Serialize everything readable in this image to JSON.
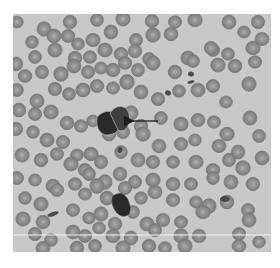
{
  "image": {
    "kind": "blood-smear-micrograph",
    "grayscale": true,
    "frame": {
      "x": 13,
      "y": 14,
      "width": 258,
      "height": 238
    },
    "colors": {
      "page_bg": "#ffffff",
      "smear_bg": "#c8c8c8",
      "rbc_rim": "#7c7c7c",
      "rbc_fill": "#8e8e8e",
      "rbc_center": "#a8a8a8",
      "dark_cell": "#2a2a2a",
      "dark_cell_light": "#3e3e3e",
      "arrow": "#1a1a1a",
      "scan_line": "#f2f2f2"
    },
    "scan_line": {
      "y": 221
    },
    "arrow": {
      "x1": 145,
      "y1": 107,
      "x2": 114,
      "y2": 107
    },
    "dark_cells": [
      {
        "name": "target-cell-left-lobe",
        "path": "M84 103 Q92 94 103 99 L108 112 Q103 122 92 121 Q82 117 84 103 Z"
      },
      {
        "name": "target-cell-right-lobe",
        "path": "M97 99 Q104 89 113 94 Q119 101 115 112 Q111 119 105 116 Z"
      },
      {
        "name": "second-dark-cell",
        "path": "M100 182 Q108 176 114 184 Q119 193 116 200 Q110 205 104 199 Q97 191 100 182 Z"
      }
    ],
    "rbc": [
      [
        4,
        8
      ],
      [
        31,
        15
      ],
      [
        57,
        8
      ],
      [
        84,
        6
      ],
      [
        110,
        5
      ],
      [
        139,
        7
      ],
      [
        162,
        8
      ],
      [
        182,
        6
      ],
      [
        216,
        8
      ],
      [
        245,
        8
      ],
      [
        19,
        28
      ],
      [
        41,
        22
      ],
      [
        55,
        22
      ],
      [
        65,
        30
      ],
      [
        80,
        26
      ],
      [
        98,
        18
      ],
      [
        123,
        26
      ],
      [
        140,
        21
      ],
      [
        158,
        20
      ],
      [
        200,
        36
      ],
      [
        231,
        18
      ],
      [
        249,
        25
      ],
      [
        3,
        50
      ],
      [
        22,
        43
      ],
      [
        42,
        36
      ],
      [
        62,
        44
      ],
      [
        77,
        43
      ],
      [
        92,
        36
      ],
      [
        108,
        40
      ],
      [
        122,
        37
      ],
      [
        136,
        45
      ],
      [
        175,
        44
      ],
      [
        198,
        34
      ],
      [
        215,
        40
      ],
      [
        240,
        34
      ],
      [
        12,
        62
      ],
      [
        29,
        58
      ],
      [
        48,
        60
      ],
      [
        61,
        52
      ],
      [
        75,
        58
      ],
      [
        88,
        54
      ],
      [
        100,
        56
      ],
      [
        112,
        49
      ],
      [
        125,
        56
      ],
      [
        140,
        49
      ],
      [
        162,
        58
      ],
      [
        180,
        47
      ],
      [
        205,
        51
      ],
      [
        222,
        52
      ],
      [
        242,
        48
      ],
      [
        4,
        76
      ],
      [
        24,
        87
      ],
      [
        42,
        75
      ],
      [
        56,
        80
      ],
      [
        70,
        76
      ],
      [
        84,
        72
      ],
      [
        100,
        74
      ],
      [
        114,
        68
      ],
      [
        128,
        78
      ],
      [
        145,
        85
      ],
      [
        166,
        77
      ],
      [
        185,
        76
      ],
      [
        200,
        72
      ],
      [
        213,
        88
      ],
      [
        236,
        70
      ],
      [
        6,
        96
      ],
      [
        22,
        100
      ],
      [
        38,
        98
      ],
      [
        54,
        109
      ],
      [
        68,
        112
      ],
      [
        80,
        107
      ],
      [
        118,
        99
      ],
      [
        128,
        112
      ],
      [
        148,
        104
      ],
      [
        168,
        110
      ],
      [
        185,
        106
      ],
      [
        201,
        108
      ],
      [
        214,
        120
      ],
      [
        237,
        104
      ],
      [
        3,
        115
      ],
      [
        20,
        118
      ],
      [
        34,
        126
      ],
      [
        50,
        128
      ],
      [
        64,
        141
      ],
      [
        78,
        140
      ],
      [
        96,
        120
      ],
      [
        110,
        118
      ],
      [
        130,
        120
      ],
      [
        146,
        132
      ],
      [
        168,
        130
      ],
      [
        182,
        126
      ],
      [
        206,
        132
      ],
      [
        225,
        138
      ],
      [
        246,
        122
      ],
      [
        9,
        141
      ],
      [
        28,
        146
      ],
      [
        44,
        140
      ],
      [
        58,
        150
      ],
      [
        72,
        156
      ],
      [
        88,
        148
      ],
      [
        108,
        138
      ],
      [
        125,
        146
      ],
      [
        140,
        148
      ],
      [
        160,
        148
      ],
      [
        183,
        148
      ],
      [
        200,
        156
      ],
      [
        216,
        146
      ],
      [
        230,
        154
      ],
      [
        249,
        144
      ],
      [
        4,
        164
      ],
      [
        22,
        166
      ],
      [
        40,
        172
      ],
      [
        62,
        170
      ],
      [
        76,
        160
      ],
      [
        92,
        168
      ],
      [
        107,
        160
      ],
      [
        122,
        168
      ],
      [
        140,
        166
      ],
      [
        160,
        170
      ],
      [
        178,
        170
      ],
      [
        200,
        164
      ],
      [
        218,
        168
      ],
      [
        240,
        170
      ],
      [
        12,
        184
      ],
      [
        28,
        190
      ],
      [
        44,
        176
      ],
      [
        72,
        180
      ],
      [
        84,
        172
      ],
      [
        94,
        184
      ],
      [
        112,
        174
      ],
      [
        128,
        184
      ],
      [
        142,
        178
      ],
      [
        160,
        186
      ],
      [
        183,
        188
      ],
      [
        196,
        192
      ],
      [
        214,
        188
      ],
      [
        235,
        196
      ],
      [
        10,
        205
      ],
      [
        30,
        208
      ],
      [
        60,
        196
      ],
      [
        76,
        204
      ],
      [
        88,
        200
      ],
      [
        102,
        210
      ],
      [
        120,
        198
      ],
      [
        134,
        210
      ],
      [
        150,
        206
      ],
      [
        168,
        208
      ],
      [
        190,
        198
      ],
      [
        236,
        206
      ],
      [
        22,
        220
      ],
      [
        38,
        226
      ],
      [
        60,
        218
      ],
      [
        72,
        222
      ],
      [
        86,
        214
      ],
      [
        100,
        222
      ],
      [
        118,
        224
      ],
      [
        142,
        216
      ],
      [
        168,
        222
      ],
      [
        186,
        222
      ],
      [
        226,
        220
      ],
      [
        246,
        228
      ],
      [
        30,
        234
      ],
      [
        64,
        234
      ],
      [
        82,
        232
      ],
      [
        110,
        234
      ],
      [
        136,
        232
      ],
      [
        152,
        234
      ],
      [
        172,
        232
      ],
      [
        226,
        232
      ]
    ],
    "debris": [
      {
        "x": 40,
        "y": 200,
        "w": 12,
        "h": 4,
        "r": -20
      },
      {
        "x": 178,
        "y": 60,
        "w": 6,
        "h": 5,
        "r": 10
      },
      {
        "x": 178,
        "y": 68,
        "w": 7,
        "h": 3,
        "r": -15
      },
      {
        "x": 107,
        "y": 136,
        "w": 5,
        "h": 6,
        "r": 15
      },
      {
        "x": 212,
        "y": 185,
        "w": 10,
        "h": 6,
        "r": 0
      },
      {
        "x": 155,
        "y": 79,
        "w": 6,
        "h": 5,
        "r": 25
      }
    ]
  }
}
